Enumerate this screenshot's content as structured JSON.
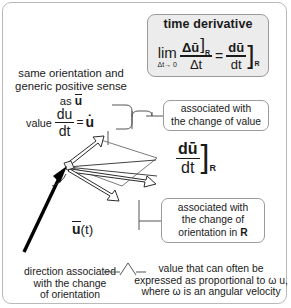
{
  "figure": {
    "frame_color": "#b9b9b9",
    "box_fill": "#ececec",
    "ink": "#1a1a1a"
  },
  "time_derivative_box": {
    "title": "time derivative",
    "limit_word": "lim",
    "limit_sub": "Δt→ 0",
    "numerator": "Δū",
    "numerator_sub": "R",
    "denominator": "Δt",
    "equals": "=",
    "rhs_numerator": "dū",
    "rhs_denominator": "dt",
    "rhs_sub": "R"
  },
  "labels": {
    "same_orientation_line1": "same orientation and",
    "same_orientation_line2": "generic positive sense",
    "same_orientation_line3": "as ū",
    "value_word": "value",
    "value_frac_num": "du",
    "value_frac_den": "dt",
    "value_equals": "=",
    "value_udot": "u̇",
    "vector_label": "ū(t)"
  },
  "callouts": [
    {
      "name": "change-of-value",
      "line1": "associated with",
      "line2": "the change of value"
    },
    {
      "name": "change-of-orientation",
      "line1": "associated with",
      "line2": "the change of",
      "line3": "orientation in R"
    }
  ],
  "derivative_expression": {
    "numerator": "dū",
    "denominator": "dt",
    "subscript": "R"
  },
  "bottom_notes": {
    "direction_line1": "direction associated",
    "direction_line2": "with the change",
    "direction_line3": "of orientation",
    "value_line1": "value that can often be",
    "value_line2": "expressed as proportional to ω u,",
    "value_line3": "where ω is an angular velocity"
  }
}
